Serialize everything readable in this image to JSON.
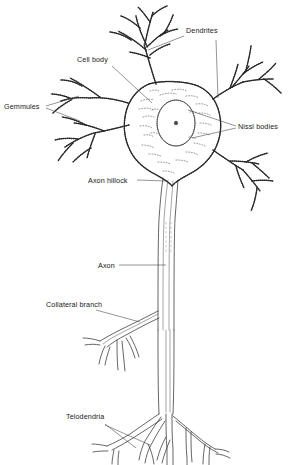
{
  "figure": {
    "background_color": "#ffffff",
    "ink_color": "#2e2e2e",
    "label_color": "#1a1a1a"
  },
  "labels": {
    "dendrites": "Dendrites",
    "cell_body": "Cell body",
    "gemmules": "Gemmules",
    "nissl_bodies": "Nissl bodies",
    "axon_hillock": "Axon hillock",
    "axon": "Axon",
    "collateral_branch": "Collateral branch",
    "telodendria": "Telodendria"
  },
  "parts": [
    {
      "id": "dendrites",
      "label": "Dendrites",
      "label_x": 186,
      "label_y": 32,
      "description": "Beaded branching processes extending from the soma, upper and right"
    },
    {
      "id": "cell-body",
      "label": "Cell body",
      "label_x": 78,
      "label_y": 62,
      "description": "Central soma with scalloped membrane"
    },
    {
      "id": "gemmules",
      "label": "Gemmules",
      "label_x": 4,
      "label_y": 108,
      "description": "Small spine knobs on the dendrite branches, left side"
    },
    {
      "id": "nissl-bodies",
      "label": "Nissl bodies",
      "label_x": 238,
      "label_y": 128,
      "description": "Stippled chromatophilic substance inside the cytoplasm"
    },
    {
      "id": "axon-hillock",
      "label": "Axon hillock",
      "label_x": 88,
      "label_y": 183,
      "description": "Cone-shaped origin of the axon at the base of the soma"
    },
    {
      "id": "axon",
      "label": "Axon",
      "label_x": 98,
      "label_y": 268,
      "description": "Long descending fibre with a break in the middle"
    },
    {
      "id": "collateral-branch",
      "label": "Collateral branch",
      "label_x": 46,
      "label_y": 307,
      "description": "Side branch leaving the axon to the left"
    },
    {
      "id": "telodendria",
      "label": "Telodendria",
      "label_x": 66,
      "label_y": 418,
      "description": "Terminal arborisation at the end of the axon"
    }
  ],
  "soma": {
    "nucleus": {
      "cx": 176,
      "cy": 123,
      "rx": 19,
      "ry": 23
    },
    "nucleolus": {
      "cx": 176,
      "cy": 123,
      "r": 1.8
    }
  }
}
